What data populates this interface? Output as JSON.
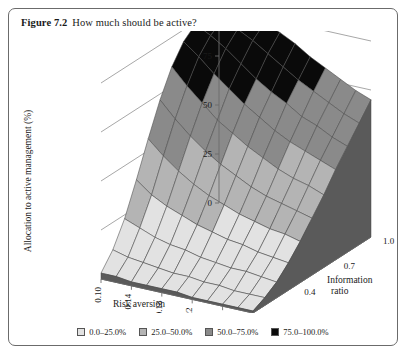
{
  "figure": {
    "label": "Figure 7.2",
    "caption": "How much should be active?"
  },
  "colors": {
    "band_0_25": "#e2e2e2",
    "band_25_50": "#b4b4b4",
    "band_50_75": "#8a8a8a",
    "band_75_100": "#0a0a0a",
    "mesh_line": "#4a4a4a",
    "axis_line": "#6b6b6b",
    "frame": "#6b6b6b",
    "floor": "#6f6f6f",
    "skirt": "#5a5a5a",
    "background": "#ffffff"
  },
  "legend": {
    "position": "bottom-center",
    "entries": [
      {
        "swatch": "#e2e2e2",
        "label": "0.0–25.0%"
      },
      {
        "swatch": "#b4b4b4",
        "label": "25.0–50.0%"
      },
      {
        "swatch": "#8a8a8a",
        "label": "50.0–75.0%"
      },
      {
        "swatch": "#0a0a0a",
        "label": "75.0–100.0%"
      }
    ]
  },
  "chart_data": {
    "type": "surface",
    "title": "How much should be active?",
    "zlabel": "Allocation to active management (%)",
    "xlabel": "Risk aversion",
    "ylabel": "Information ratio",
    "grid": true,
    "zlim": [
      0,
      100
    ],
    "zticks": [
      0,
      25,
      50,
      75,
      100
    ],
    "ztick_labels": [
      "0",
      "25",
      "50",
      "75",
      "100"
    ],
    "xlim": [
      0.1,
      0.3
    ],
    "xticks": [
      0.1,
      0.14,
      0.18,
      0.22,
      0.26,
      0.3
    ],
    "xtick_labels": [
      "0.10",
      "0.14",
      "0.18",
      "0.22",
      "0.26",
      "0.30"
    ],
    "ylim": [
      0.1,
      1.0
    ],
    "yticks": [
      0.1,
      0.4,
      0.7,
      1.0
    ],
    "ytick_labels": [
      "0.1",
      "0.4",
      "0.7",
      "1.0"
    ],
    "x": [
      0.1,
      0.12,
      0.14,
      0.16,
      0.18,
      0.2,
      0.22,
      0.24,
      0.26,
      0.28,
      0.3
    ],
    "y": [
      0.1,
      0.19,
      0.28,
      0.37,
      0.46,
      0.55,
      0.64,
      0.73,
      0.82,
      0.91,
      1.0
    ],
    "z": [
      [
        3,
        3,
        2,
        2,
        2,
        2,
        1,
        1,
        1,
        1,
        1
      ],
      [
        11,
        9,
        8,
        7,
        6,
        6,
        5,
        5,
        4,
        4,
        4
      ],
      [
        23,
        20,
        17,
        15,
        14,
        12,
        11,
        10,
        10,
        9,
        8
      ],
      [
        39,
        33,
        29,
        26,
        23,
        21,
        19,
        18,
        16,
        15,
        14
      ],
      [
        56,
        49,
        43,
        38,
        34,
        31,
        28,
        26,
        24,
        23,
        21
      ],
      [
        72,
        64,
        57,
        51,
        46,
        42,
        38,
        35,
        33,
        31,
        29
      ],
      [
        85,
        77,
        70,
        63,
        58,
        53,
        49,
        45,
        42,
        40,
        37
      ],
      [
        94,
        88,
        81,
        75,
        69,
        64,
        59,
        55,
        52,
        49,
        46
      ],
      [
        99,
        95,
        90,
        84,
        78,
        73,
        69,
        64,
        61,
        57,
        54
      ],
      [
        100,
        99,
        96,
        92,
        87,
        82,
        77,
        73,
        69,
        65,
        62
      ],
      [
        100,
        100,
        100,
        97,
        94,
        90,
        85,
        81,
        77,
        73,
        70
      ]
    ],
    "bands": [
      {
        "min": 0,
        "max": 25,
        "color": "#e2e2e2",
        "label": "0.0–25.0%"
      },
      {
        "min": 25,
        "max": 50,
        "color": "#b4b4b4",
        "label": "25.0–50.0%"
      },
      {
        "min": 50,
        "max": 75,
        "color": "#8a8a8a",
        "label": "50.0–75.0%"
      },
      {
        "min": 75,
        "max": 100,
        "color": "#0a0a0a",
        "label": "75.0–100.0%"
      }
    ],
    "projection": {
      "origin_x": 92,
      "origin_y": 248,
      "x_axis_dx": 152,
      "x_axis_dy": 34,
      "y_axis_dx": 118,
      "y_axis_dy": -76,
      "z_height": 196
    }
  }
}
